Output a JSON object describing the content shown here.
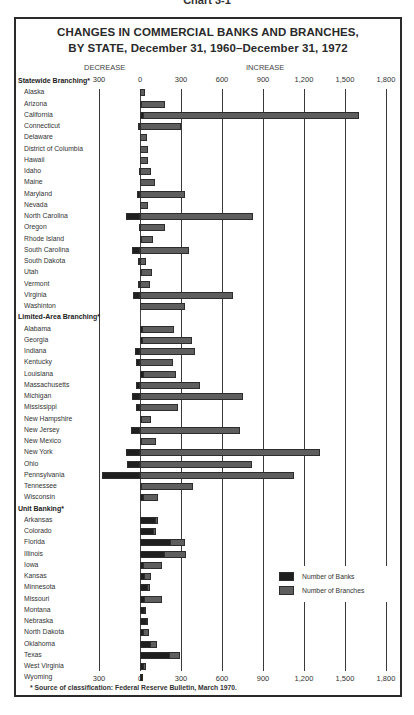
{
  "caption": "Chart 3-1",
  "chart_data": {
    "type": "bar",
    "orientation": "horizontal",
    "title": "CHANGES IN COMMERCIAL BANKS AND BRANCHES, BY STATE, December 31, 1960–December 31, 1972",
    "title_lines": [
      "CHANGES IN COMMERCIAL BANKS AND BRANCHES,",
      "BY STATE, December 31, 1960–December 31, 1972"
    ],
    "direction_labels": {
      "decrease": "DECREASE",
      "increase": "INCREASE"
    },
    "xlim": [
      -300,
      1800
    ],
    "x_ticks": [
      -300,
      0,
      300,
      600,
      900,
      1200,
      1500,
      1800
    ],
    "x_tick_labels": [
      "300",
      "0",
      "300",
      "600",
      "900",
      "1,200",
      "1,500",
      "1,800"
    ],
    "grid": true,
    "legend": [
      {
        "name": "Number of Banks",
        "color": "#1f1f1f"
      },
      {
        "name": "Number of Branches",
        "color": "#5e5e5e"
      }
    ],
    "legend_position": "lower right",
    "footnote": "* Source of classification:  Federal Reserve Bulletin, March 1970.",
    "groups": [
      {
        "name": "Statewide Branching*",
        "categories": [
          "Alaska",
          "Arizona",
          "California",
          "Connecticut",
          "Delaware",
          "District of Columbia",
          "Hawaii",
          "Idaho",
          "Maine",
          "Maryland",
          "Nevada",
          "North Carolina",
          "Oregon",
          "Rhode Island",
          "South Carolina",
          "South Dakota",
          "Utah",
          "Vermont",
          "Virginia",
          "Washinton"
        ],
        "series": [
          {
            "name": "Number of Banks",
            "values": [
              0,
              5,
              30,
              -15,
              0,
              0,
              0,
              -10,
              0,
              -20,
              0,
              -100,
              -5,
              5,
              -55,
              -15,
              5,
              -15,
              -50,
              0
            ]
          },
          {
            "name": "Number of Branches",
            "values": [
              40,
              180,
              1600,
              300,
              50,
              55,
              60,
              80,
              110,
              330,
              55,
              830,
              180,
              95,
              360,
              45,
              90,
              70,
              680,
              330
            ]
          }
        ]
      },
      {
        "name": "Limited-Area Branching*",
        "categories": [
          "Alabama",
          "Georgia",
          "Indiana",
          "Kentucky",
          "Louisiana",
          "Massachusetts",
          "Michigan",
          "Mississippi",
          "New Hampshire",
          "New Jersey",
          "New Mexico",
          "New York",
          "Ohio",
          "Pennsylvania",
          "Tennessee",
          "Wisconsin"
        ],
        "series": [
          {
            "name": "Number of Banks",
            "values": [
              20,
              20,
              -40,
              -30,
              30,
              -30,
              -60,
              -30,
              5,
              -65,
              10,
              -100,
              -95,
              -280,
              10,
              30
            ]
          },
          {
            "name": "Number of Branches",
            "values": [
              250,
              380,
              400,
              240,
              260,
              440,
              750,
              280,
              80,
              730,
              120,
              1320,
              820,
              1130,
              390,
              130
            ]
          }
        ]
      },
      {
        "name": "Unit Banking*",
        "categories": [
          "Arkansas",
          "Colorado",
          "Florida",
          "Illinois",
          "Iowa",
          "Kansas",
          "Minnesota",
          "Missouri",
          "Montana",
          "Nebraska",
          "North Dakota",
          "Oklahoma",
          "Texas",
          "West Virginia",
          "Wyoming"
        ],
        "series": [
          {
            "name": "Number of Banks",
            "values": [
              120,
              100,
              230,
              180,
              30,
              40,
              60,
              40,
              40,
              50,
              30,
              80,
              220,
              30,
              20
            ]
          },
          {
            "name": "Number of Branches",
            "values": [
              130,
              120,
              330,
              340,
              160,
              80,
              70,
              160,
              45,
              60,
              65,
              125,
              290,
              45,
              25
            ]
          }
        ]
      }
    ]
  }
}
